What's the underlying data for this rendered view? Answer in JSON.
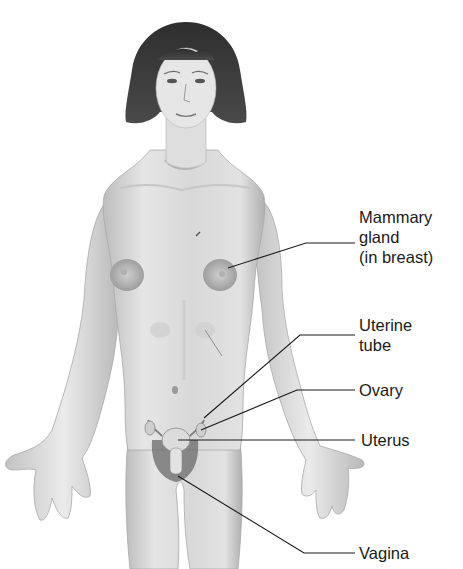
{
  "figure": {
    "labels": [
      {
        "id": "mammary-gland",
        "text": "Mammary\ngland\n(in breast)"
      },
      {
        "id": "uterine-tube",
        "text": "Uterine\ntube"
      },
      {
        "id": "ovary",
        "text": "Ovary"
      },
      {
        "id": "uterus",
        "text": "Uterus"
      },
      {
        "id": "vagina",
        "text": "Vagina"
      }
    ]
  },
  "colors": {
    "background": "#ffffff",
    "skin_light": "#e9e9e9",
    "skin_shade": "#bdbdbd",
    "hair": "#3a3a3a",
    "leader_line": "#1a1a1a",
    "label_text": "#1a1a1a"
  }
}
